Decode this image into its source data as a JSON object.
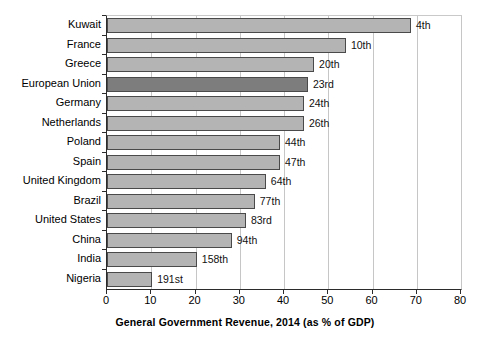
{
  "chart_data": {
    "type": "bar",
    "orientation": "horizontal",
    "title": "",
    "xlabel": "General Government Revenue, 2014 (as % of GDP)",
    "ylabel": "",
    "xlim": [
      0,
      80
    ],
    "xticks": [
      0,
      10,
      20,
      30,
      40,
      50,
      60,
      70,
      80
    ],
    "xticklabels": [
      "0",
      "10",
      "20",
      "30",
      "40",
      "50",
      "60",
      "70",
      "80"
    ],
    "grid": "vertical",
    "legend": "none",
    "categories": [
      "Kuwait",
      "France",
      "Greece",
      "European Union",
      "Germany",
      "Netherlands",
      "Poland",
      "Spain",
      "United Kingdom",
      "Brazil",
      "United States",
      "China",
      "India",
      "Nigeria"
    ],
    "values": [
      68.7,
      54.0,
      46.8,
      45.4,
      44.5,
      44.5,
      39.1,
      39.1,
      35.9,
      33.4,
      31.4,
      28.2,
      20.3,
      10.2
    ],
    "annotations": [
      "4th",
      "10th",
      "20th",
      "23rd",
      "24th",
      "26th",
      "44th",
      "47th",
      "64th",
      "77th",
      "83rd",
      "94th",
      "158th",
      "191st"
    ],
    "highlight_category": "European Union",
    "colors": {
      "bar": "#b4b4b4",
      "bar_highlight": "#7d7d7d",
      "bar_edge": "#4a4a4a",
      "axis": "#2b2b2b",
      "grid": "#c6c6c6",
      "text": "#000000",
      "background": "#ffffff"
    }
  }
}
